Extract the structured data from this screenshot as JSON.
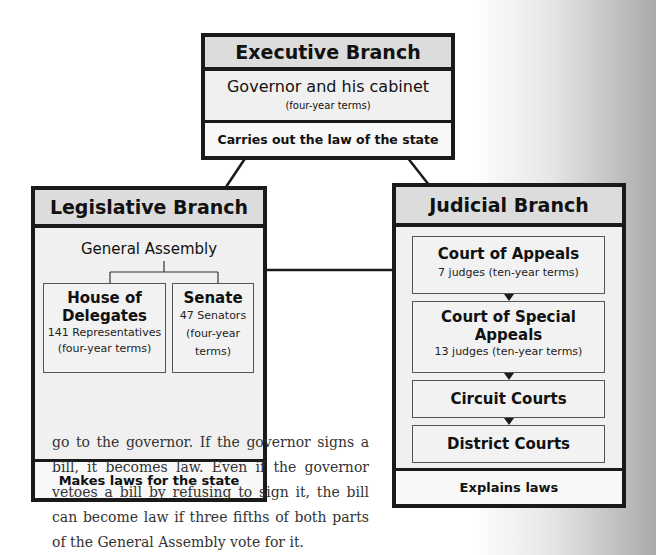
{
  "executive": {
    "title": "Executive Branch",
    "body_title": "Governor and his cabinet",
    "body_sub": "(four-year terms)",
    "footer": "Carries out the law of the state"
  },
  "legislative": {
    "title": "Legislative Branch",
    "assembly": "General Assembly",
    "house": {
      "title_1": "House of",
      "title_2": "Delegates",
      "count": "141 Representatives",
      "terms": "(four-year terms)"
    },
    "senate": {
      "title": "Senate",
      "count": "47 Senators",
      "terms_1": "(four-year",
      "terms_2": "terms)"
    },
    "footer": "Makes laws for the state"
  },
  "judicial": {
    "title": "Judicial Branch",
    "courts": [
      {
        "name": "Court of Appeals",
        "detail": "7 judges (ten-year terms)"
      },
      {
        "name_1": "Court of Special",
        "name_2": "Appeals",
        "detail": "13 judges (ten-year terms)"
      },
      {
        "name": "Circuit Courts"
      },
      {
        "name": "District Courts"
      }
    ],
    "footer": "Explains laws"
  },
  "paragraph": "go to the governor. If the governor signs a bill, it becomes law. Even if the governor vetoes a bill by refusing to sign it, the bill can become law if three fifths of both parts of the General Assembly vote for it."
}
